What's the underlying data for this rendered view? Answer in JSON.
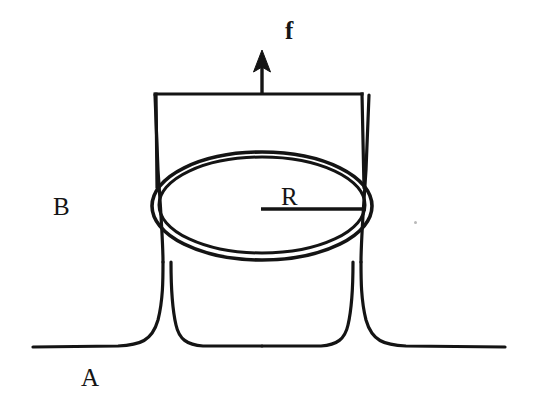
{
  "figure": {
    "background_color": "#ffffff",
    "ink_color": "#141414",
    "width": 533,
    "height": 405,
    "labels": {
      "force": "f",
      "radius": "R",
      "region_upper": "B",
      "region_lower": "A"
    },
    "elements": {
      "force_arrow_name": "force-arrow",
      "ring_name": "ring-ellipse",
      "radius_line_name": "radius-line",
      "film_name": "soap-film-outline",
      "baseline_name": "liquid-surface-baseline",
      "frame_name": "rectangular-frame"
    },
    "geometry": {
      "arrow_tip_y": 52,
      "arrow_x": 262,
      "frame_left_x": 155,
      "frame_right_x": 362,
      "frame_top_y": 94,
      "ellipse_center_x": 262,
      "ellipse_center_y": 206,
      "ellipse_rx": 110,
      "ellipse_ry": 54,
      "radius_line_from_x": 261,
      "radius_line_to_x": 366,
      "radius_line_y": 209,
      "baseline_y": 348,
      "film_bottom_y": 346
    }
  }
}
